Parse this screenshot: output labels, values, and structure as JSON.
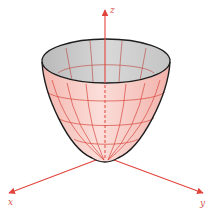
{
  "figure": {
    "type": "paraboloid",
    "axes": {
      "x": {
        "label": "x"
      },
      "y": {
        "label": "y"
      },
      "z": {
        "label": "z"
      }
    },
    "colors": {
      "axis": "#e2443c",
      "outer_surface": "#f7c9c3",
      "inner_surface": "#cfcfcf",
      "mesh": "#d9473f",
      "outline": "#1e1e1e"
    }
  }
}
